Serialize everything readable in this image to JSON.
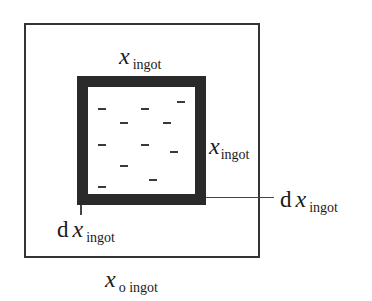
{
  "diagram": {
    "type": "nested-squares",
    "outer_box": {
      "label": {
        "d": "",
        "var": "x",
        "sub": "o ingot"
      }
    },
    "inner_box": {
      "top_label": {
        "var": "x",
        "sub": "ingot"
      },
      "right_label": {
        "var": "x",
        "sub": "ingot"
      },
      "wall_thickness_right_label": {
        "d": "d",
        "var": "x",
        "sub": "ingot"
      },
      "wall_thickness_bottom_label": {
        "d": "d",
        "var": "x",
        "sub": "ingot"
      },
      "fill_pattern": "dash"
    },
    "colors": {
      "outer_stroke": "#333333",
      "inner_wall": "#2a2a2a",
      "background": "#ffffff"
    }
  }
}
